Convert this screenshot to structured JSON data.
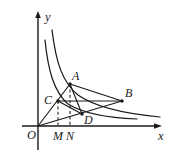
{
  "figure": {
    "kind": "geometry-diagram",
    "background_color": "#ffffff",
    "stroke_color": "#1a1a1a",
    "axes": {
      "x_label": "x",
      "y_label": "y",
      "origin_label": "O"
    },
    "point_labels": {
      "A": "A",
      "B": "B",
      "C": "C",
      "D": "D",
      "M": "M",
      "N": "N"
    },
    "points": {
      "O": {
        "x": 38,
        "y": 126
      },
      "A": {
        "x": 70,
        "y": 84
      },
      "B": {
        "x": 122,
        "y": 101
      },
      "C": {
        "x": 58,
        "y": 101
      },
      "D": {
        "x": 82,
        "y": 114
      },
      "M": {
        "x": 58,
        "y": 126
      },
      "N": {
        "x": 70,
        "y": 126
      }
    },
    "label_positions": {
      "y": {
        "x": 45,
        "y": 21
      },
      "x": {
        "x": 158,
        "y": 140
      },
      "O": {
        "x": 27,
        "y": 139
      },
      "A": {
        "x": 72,
        "y": 80
      },
      "B": {
        "x": 125,
        "y": 97
      },
      "C": {
        "x": 44,
        "y": 104
      },
      "D": {
        "x": 84,
        "y": 124
      },
      "M": {
        "x": 53,
        "y": 140
      },
      "N": {
        "x": 66,
        "y": 140
      }
    },
    "curves": {
      "outer": {
        "name": "outer-hyperbola",
        "path": "M 52 30 C 56 62, 62 82, 78 95 C 95 107, 128 114, 160 117"
      },
      "inner": {
        "name": "inner-hyperbola",
        "path": "M 45 40 C 48 70, 54 92, 68 104 C 84 114, 112 118, 137 119"
      }
    },
    "segments": {
      "ray_OA": {
        "from": "O",
        "to": "A"
      },
      "ray_OB": {
        "from": "O",
        "to": "B"
      },
      "chord_AB": {
        "from": "A",
        "to": "B"
      },
      "chord_CB": {
        "from": "C",
        "to": "B"
      },
      "chord_CD": {
        "from": "C",
        "to": "D"
      },
      "chord_AD": {
        "from": "A",
        "to": "D"
      }
    },
    "dashed_drops": {
      "C_to_M": {
        "from": "C",
        "to": "M"
      },
      "A_to_N": {
        "from": "A",
        "to": "N"
      }
    }
  }
}
